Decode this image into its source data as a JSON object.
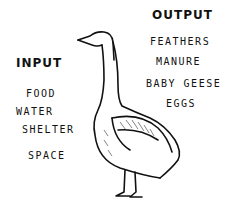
{
  "input": {
    "heading": "INPUT",
    "items": [
      "FOOD",
      "WATER",
      "SHELTER",
      "SPACE"
    ]
  },
  "output": {
    "heading": "OUTPUT",
    "items": [
      "FEATHERS",
      "MANURE",
      "BABY GEESE",
      "EGGS"
    ]
  },
  "illustration": "goose"
}
